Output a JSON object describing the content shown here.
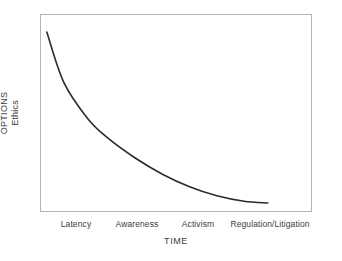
{
  "chart_data": {
    "type": "line",
    "title": "",
    "xlabel": "TIME",
    "ylabel": "OPTIONS",
    "ylabel_secondary": "Ethics",
    "categories": [
      "Latency",
      "Awareness",
      "Activism",
      "Regulation/Litigation"
    ],
    "x": [
      0,
      1,
      2,
      3
    ],
    "series": [
      {
        "name": "Options / Ethics over time",
        "values": [
          100,
          46,
          20,
          6
        ]
      }
    ],
    "points": [
      {
        "x": 0.1,
        "y": 100
      },
      {
        "x": 0.35,
        "y": 72
      },
      {
        "x": 0.7,
        "y": 52
      },
      {
        "x": 1.0,
        "y": 41
      },
      {
        "x": 1.4,
        "y": 30
      },
      {
        "x": 1.8,
        "y": 21
      },
      {
        "x": 2.2,
        "y": 14
      },
      {
        "x": 2.6,
        "y": 9
      },
      {
        "x": 3.0,
        "y": 6
      },
      {
        "x": 3.35,
        "y": 5
      }
    ],
    "xlim": [
      0,
      4
    ],
    "ylim": [
      0,
      110
    ],
    "grid": false,
    "legend": false,
    "legend_position": "none",
    "annotations": [],
    "line_color": "#2b2b2b",
    "frame_color": "#b4b4b4",
    "background_color": "#ffffff"
  },
  "axes": {
    "y": {
      "label_primary": "OPTIONS",
      "label_secondary": "Ethics"
    },
    "x": {
      "title": "TIME",
      "ticks": [
        {
          "label": "Latency",
          "pos_px": 76
        },
        {
          "label": "Awareness",
          "pos_px": 137
        },
        {
          "label": "Activism",
          "pos_px": 198
        },
        {
          "label": "Regulation/Litigation",
          "pos_px": 270
        }
      ]
    }
  }
}
